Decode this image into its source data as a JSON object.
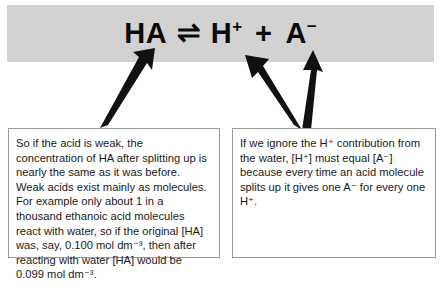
{
  "figure": {
    "type": "annotated-chemistry-equation-diagram",
    "background_color": "#ffffff"
  },
  "equation_band": {
    "background_color": "#d2d2d2",
    "equation_plain": "HA ⇌ H+ + A−",
    "terms": {
      "reactant": "HA",
      "equilibrium_arrow": "⇌",
      "product_1_base": "H",
      "product_1_charge": "+",
      "plus": "+",
      "product_2_base": "A",
      "product_2_charge": "−"
    }
  },
  "notes": {
    "left": {
      "text": "So if the acid is weak, the concentration of HA after splitting up is nearly the same as it was before. Weak acids exist mainly as molecules. For example only about 1 in a thousand ethanoic acid molecules react with water, so if the original [HA] was, say, 0.100 mol dm⁻³, then after reacting with water [HA] would be 0.099 mol dm⁻³.",
      "border_color": "#9a9a9a"
    },
    "right": {
      "text": "If we ignore the H⁺ contribution from the water, [H⁺] must equal [A⁻] because every time an acid molecule splits up it gives one A⁻ for every one H⁺.",
      "border_color": "#9a9a9a"
    }
  },
  "arrows": {
    "color": "#111111",
    "items": [
      {
        "name": "arrow-left-note-to-HA",
        "from_label": "left note box",
        "to_label": "HA"
      },
      {
        "name": "arrow-right-note-to-H-plus",
        "from_label": "right note box",
        "to_label": "H+"
      },
      {
        "name": "arrow-right-note-to-A-minus",
        "from_label": "right note box",
        "to_label": "A−"
      }
    ]
  }
}
